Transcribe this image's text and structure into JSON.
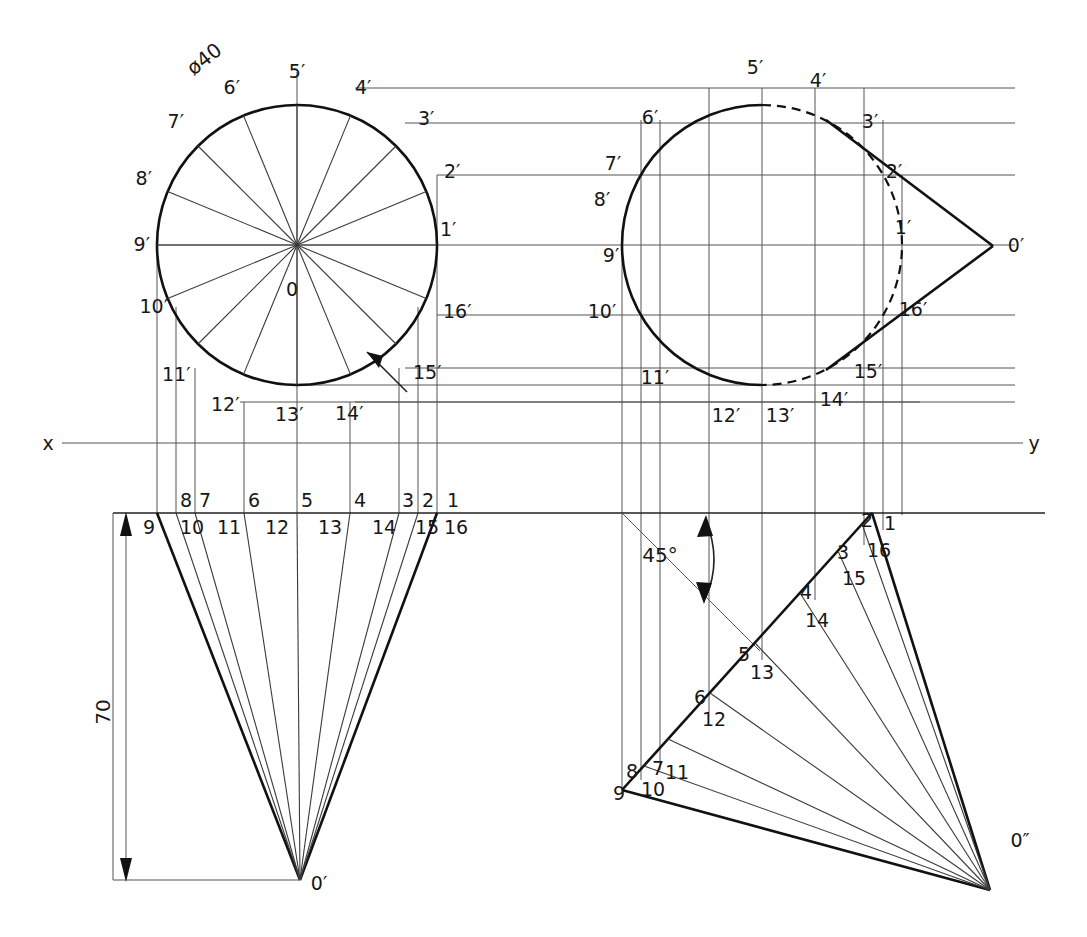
{
  "drawing": {
    "title": "Cone development orthographic projection",
    "dimensions": {
      "diameter_label": "ø40",
      "height_label": "70",
      "angle_label": "45°"
    },
    "axis": {
      "x_label": "x",
      "y_label": "y"
    },
    "apex_labels": {
      "front_apex": "0′",
      "side_apex": "0′",
      "aux_apex": "0″",
      "center": "0"
    },
    "views": [
      {
        "name": "top-view-circle",
        "kind": "circle",
        "center": [
          297,
          245
        ],
        "radius": 140,
        "divisions": 16,
        "point_labels": [
          "1′",
          "2′",
          "3′",
          "4′",
          "5′",
          "6′",
          "7′",
          "8′",
          "9′",
          "10′",
          "11′",
          "12′",
          "13′",
          "14′",
          "15′",
          "16′"
        ]
      },
      {
        "name": "side-view-ellipse",
        "kind": "circle-with-cone",
        "center": [
          762,
          245
        ],
        "radius": 140,
        "apex": [
          993,
          246
        ],
        "point_labels": [
          "1′",
          "2′",
          "3′",
          "4′",
          "5′",
          "6′",
          "7′",
          "8′",
          "9′",
          "10′",
          "11′",
          "12′",
          "13′",
          "14′",
          "15′",
          "16′"
        ]
      },
      {
        "name": "front-view-triangle",
        "kind": "cone-front",
        "baseline_y": 513,
        "apex": [
          300,
          880
        ],
        "base_left": [
          157,
          513
        ],
        "base_right": [
          437,
          513
        ],
        "height": 70,
        "top_labels": [
          "1",
          "2",
          "3",
          "4",
          "5",
          "6",
          "7",
          "8"
        ],
        "bottom_labels": [
          "9",
          "10",
          "11",
          "12",
          "13",
          "14",
          "15",
          "16"
        ]
      },
      {
        "name": "auxiliary-view",
        "kind": "cone-rotated-45",
        "apex": [
          990,
          890
        ],
        "axis_angle": "45°",
        "point_labels": [
          "1",
          "2",
          "3",
          "4",
          "5",
          "6",
          "7",
          "8",
          "9",
          "10",
          "11",
          "12",
          "13",
          "14",
          "15",
          "16"
        ]
      }
    ],
    "circle_labels": [
      {
        "id": "c1",
        "text": "1′",
        "x": 440,
        "y": 230
      },
      {
        "id": "c2",
        "text": "2′",
        "x": 444,
        "y": 172
      },
      {
        "id": "c3",
        "text": "3′",
        "x": 418,
        "y": 119
      },
      {
        "id": "c4",
        "text": "4′",
        "x": 355,
        "y": 88
      },
      {
        "id": "c5",
        "text": "5′",
        "x": 297,
        "y": 72
      },
      {
        "id": "c6",
        "text": "6′",
        "x": 240,
        "y": 88
      },
      {
        "id": "c7",
        "text": "7′",
        "x": 180,
        "y": 122
      },
      {
        "id": "c8",
        "text": "8′",
        "x": 143,
        "y": 179
      },
      {
        "id": "c9",
        "text": "9′",
        "x": 132,
        "y": 245
      },
      {
        "id": "c10",
        "text": "10′",
        "x": 143,
        "y": 307
      },
      {
        "id": "c11",
        "text": "11′",
        "x": 172,
        "y": 374
      },
      {
        "id": "c12",
        "text": "12′",
        "x": 228,
        "y": 403
      },
      {
        "id": "c13",
        "text": "13′",
        "x": 292,
        "y": 412
      },
      {
        "id": "c14",
        "text": "14′",
        "x": 348,
        "y": 411
      },
      {
        "id": "c15",
        "text": "15′",
        "x": 425,
        "y": 372
      },
      {
        "id": "c16",
        "text": "16′",
        "x": 458,
        "y": 310
      }
    ],
    "side_labels": [
      {
        "id": "s5",
        "text": "5′",
        "x": 755,
        "y": 68
      },
      {
        "id": "s4",
        "text": "4′",
        "x": 822,
        "y": 81
      },
      {
        "id": "s3",
        "text": "3′",
        "x": 870,
        "y": 122
      },
      {
        "id": "s2",
        "text": "2′",
        "x": 894,
        "y": 172
      },
      {
        "id": "s1",
        "text": "1′",
        "x": 902,
        "y": 228
      },
      {
        "id": "s16",
        "text": "16′",
        "x": 907,
        "y": 310
      },
      {
        "id": "s15",
        "text": "15′",
        "x": 865,
        "y": 370
      },
      {
        "id": "s14",
        "text": "14′",
        "x": 833,
        "y": 398
      },
      {
        "id": "s13",
        "text": "13′",
        "x": 778,
        "y": 414
      },
      {
        "id": "s12",
        "text": "12′",
        "x": 724,
        "y": 414
      },
      {
        "id": "s11",
        "text": "11′",
        "x": 652,
        "y": 377
      },
      {
        "id": "s10",
        "text": "10′",
        "x": 600,
        "y": 311
      },
      {
        "id": "s9",
        "text": "9′",
        "x": 612,
        "y": 255
      },
      {
        "id": "s8",
        "text": "8′",
        "x": 602,
        "y": 199
      },
      {
        "id": "s7",
        "text": "7′",
        "x": 613,
        "y": 164
      },
      {
        "id": "s6",
        "text": "6′",
        "x": 648,
        "y": 118
      }
    ],
    "front_labels_top": [
      {
        "id": "f1",
        "text": "1",
        "x": 447,
        "y": 501
      },
      {
        "id": "f2",
        "text": "2",
        "x": 428,
        "y": 501
      },
      {
        "id": "f3",
        "text": "3",
        "x": 408,
        "y": 501
      },
      {
        "id": "f4",
        "text": "4",
        "x": 360,
        "y": 501
      },
      {
        "id": "f5",
        "text": "5",
        "x": 303,
        "y": 501
      },
      {
        "id": "f6",
        "text": "6",
        "x": 247,
        "y": 501
      },
      {
        "id": "f7",
        "text": "7",
        "x": 198,
        "y": 501
      },
      {
        "id": "f8",
        "text": "8",
        "x": 179,
        "y": 501
      }
    ],
    "front_labels_bottom": [
      {
        "id": "f9",
        "text": "9",
        "x": 150,
        "y": 527
      },
      {
        "id": "f10",
        "text": "10",
        "x": 183,
        "y": 527
      },
      {
        "id": "f11",
        "text": "11",
        "x": 222,
        "y": 527
      },
      {
        "id": "f12",
        "text": "12",
        "x": 270,
        "y": 527
      },
      {
        "id": "f13",
        "text": "13",
        "x": 325,
        "y": 527
      },
      {
        "id": "f14",
        "text": "14",
        "x": 380,
        "y": 527
      },
      {
        "id": "f15",
        "text": "15",
        "x": 423,
        "y": 527
      },
      {
        "id": "f16",
        "text": "16",
        "x": 451,
        "y": 527
      }
    ],
    "aux_labels": [
      {
        "id": "a1",
        "text": "1",
        "x": 884,
        "y": 524
      },
      {
        "id": "a2",
        "text": "2",
        "x": 866,
        "y": 521
      },
      {
        "id": "a3",
        "text": "3",
        "x": 842,
        "y": 553
      },
      {
        "id": "a16",
        "text": "16",
        "x": 873,
        "y": 551
      },
      {
        "id": "a15",
        "text": "15",
        "x": 849,
        "y": 578
      },
      {
        "id": "a4",
        "text": "4",
        "x": 805,
        "y": 592
      },
      {
        "id": "a14",
        "text": "14",
        "x": 812,
        "y": 620
      },
      {
        "id": "a5",
        "text": "5",
        "x": 742,
        "y": 654
      },
      {
        "id": "a13",
        "text": "13",
        "x": 757,
        "y": 672
      },
      {
        "id": "a6",
        "text": "6",
        "x": 699,
        "y": 697
      },
      {
        "id": "a12",
        "text": "12",
        "x": 709,
        "y": 719
      },
      {
        "id": "a7",
        "text": "7",
        "x": 657,
        "y": 768
      },
      {
        "id": "a11",
        "text": "11",
        "x": 673,
        "y": 772
      },
      {
        "id": "a8",
        "text": "8",
        "x": 631,
        "y": 771
      },
      {
        "id": "a10",
        "text": "10",
        "x": 651,
        "y": 789
      },
      {
        "id": "a9",
        "text": "9",
        "x": 623,
        "y": 793
      }
    ]
  }
}
